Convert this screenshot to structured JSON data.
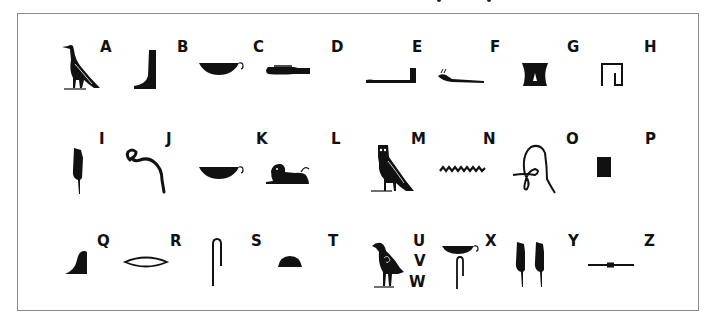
{
  "colors": {
    "ink": "#111111",
    "border": "#8a8a8a",
    "background": "#ffffff"
  },
  "rows": [
    {
      "letters": [
        "A",
        "B",
        "C",
        "D",
        "E",
        "F",
        "G",
        "H"
      ],
      "glyphs": [
        "vulture",
        "foot",
        "basket-with-handle",
        "hand",
        "forearm",
        "horned-viper",
        "stand",
        "reed-shelter"
      ]
    },
    {
      "letters": [
        "I",
        "J",
        "K",
        "L",
        "M",
        "N",
        "O",
        "P"
      ],
      "glyphs": [
        "reed-leaf",
        "cobra",
        "basket-with-handle",
        "recumbent-lion",
        "owl",
        "water-ripple",
        "twisted-flax",
        "stool"
      ]
    },
    {
      "letters": [
        "Q",
        "R",
        "S",
        "T",
        "U V W",
        "X",
        "Y",
        "Z"
      ],
      "glyphs": [
        "hill-slope",
        "mouth",
        "folded-cloth",
        "bread-loaf",
        "quail-chick",
        "basket-and-cloth",
        "double-reed",
        "door-bolt"
      ]
    }
  ],
  "letters": {
    "A": "A",
    "B": "B",
    "C": "C",
    "D": "D",
    "E": "E",
    "F": "F",
    "G": "G",
    "H": "H",
    "I": "I",
    "J": "J",
    "K": "K",
    "L": "L",
    "M": "M",
    "N": "N",
    "O": "O",
    "P": "P",
    "Q": "Q",
    "R": "R",
    "S": "S",
    "T": "T",
    "U": "U",
    "V": "V",
    "W": "W",
    "X": "X",
    "Y": "Y",
    "Z": "Z"
  }
}
